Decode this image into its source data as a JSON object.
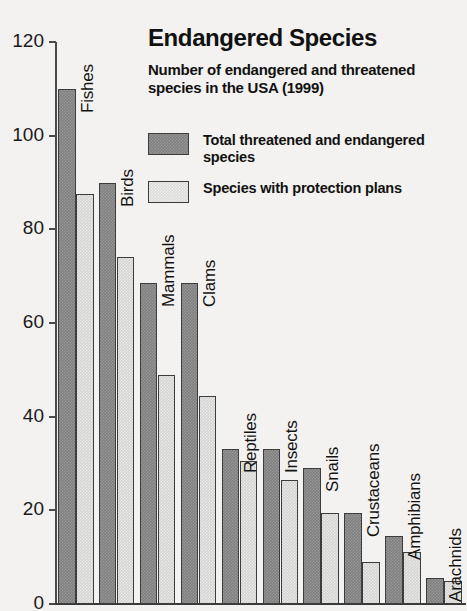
{
  "chart_data": {
    "type": "bar",
    "title": "Endangered Species",
    "subtitle": "Number of endangered and threatened species in the USA (1999)",
    "xlabel": "",
    "ylabel": "",
    "ylim": [
      0,
      120
    ],
    "ytick_labels": [
      "120",
      "100",
      "80",
      "60",
      "40",
      "20",
      "0"
    ],
    "yticks": [
      120,
      100,
      80,
      60,
      40,
      20,
      0
    ],
    "grid": false,
    "legend_position": "upper-right-inside",
    "categories": [
      "Fishes",
      "Birds",
      "Mammals",
      "Clams",
      "Reptiles",
      "Insects",
      "Snails",
      "Crustaceans",
      "Amphibians",
      "Arachnids"
    ],
    "series": [
      {
        "name": "Total threatened and endangered species",
        "color": "#808080",
        "values": [
          110,
          90,
          68.5,
          68.5,
          33,
          33,
          29,
          19.5,
          14.5,
          5.5
        ]
      },
      {
        "name": "Species with protection plans",
        "color": "#d3d3d1",
        "values": [
          87.5,
          74,
          49,
          44.5,
          30.5,
          26.5,
          19.5,
          9,
          11,
          5
        ]
      }
    ]
  },
  "legend": {
    "items": [
      {
        "label": "Total threatened and endangered species",
        "swatch": "total"
      },
      {
        "label": "Species with protection plans",
        "swatch": "plans"
      }
    ]
  },
  "colors": {
    "background": "#f3f2f0",
    "axis": "#3c3c3c",
    "text": "#111111",
    "series_total": "#808080",
    "series_plans": "#d3d3d1"
  }
}
